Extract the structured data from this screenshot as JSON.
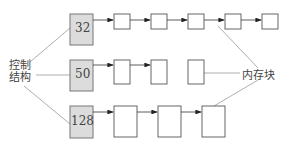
{
  "control_label_line1": "控制",
  "control_label_line2": "结构",
  "memory_label": "内存块",
  "rows": [
    {
      "size": "32",
      "blocks": 6
    },
    {
      "size": "50",
      "blocks": 2
    },
    {
      "size": "128",
      "blocks": 3
    }
  ],
  "colors": {
    "control_fill": "#dcdcdc",
    "stroke": "#555555",
    "line": "#999999"
  }
}
